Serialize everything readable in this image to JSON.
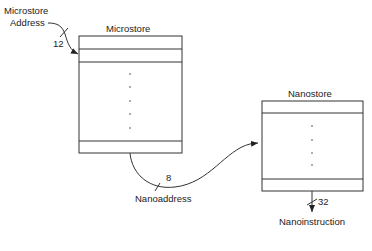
{
  "diagram": {
    "microstore": {
      "title": "Microstore",
      "input_label_line1": "Microstore",
      "input_label_line2": "Address",
      "input_width": "12"
    },
    "nanostore": {
      "title": "Nanostore",
      "output_label": "Nanoinstruction",
      "output_width": "32"
    },
    "link": {
      "label": "Nanoaddress",
      "width": "8"
    },
    "colors": {
      "line": "#333333",
      "text": "#222222",
      "background": "#ffffff"
    }
  }
}
